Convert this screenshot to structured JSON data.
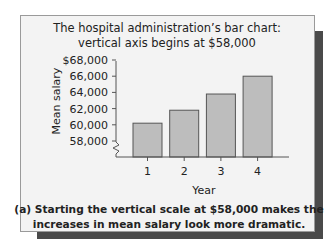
{
  "chart_data": {
    "type": "bar",
    "title": [
      "The hospital administration’s bar chart:",
      "vertical axis begins at $58,000"
    ],
    "categories": [
      "1",
      "2",
      "3",
      "4"
    ],
    "values": [
      60200,
      61800,
      63800,
      66000
    ],
    "xlabel": "Year",
    "ylabel": "Mean salary",
    "ylim": [
      58000,
      68000
    ],
    "y_ticks": [
      {
        "value": 68000,
        "label": "$68,000"
      },
      {
        "value": 66000,
        "label": "66,000"
      },
      {
        "value": 64000,
        "label": "64,000"
      },
      {
        "value": 62000,
        "label": "62,000"
      },
      {
        "value": 60000,
        "label": "60,000"
      },
      {
        "value": 58000,
        "label": "58,000"
      }
    ],
    "axis_break": true,
    "grid": false,
    "bar_color": "#bdbdbd",
    "caption": [
      "(a) Starting the vertical scale at $58,000 makes the",
      "increases in mean salary look more dramatic."
    ]
  }
}
